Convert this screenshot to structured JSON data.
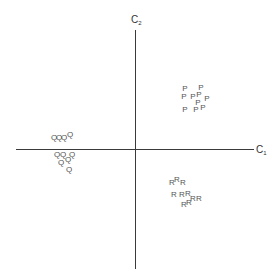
{
  "axes": {
    "x_label": "C",
    "x_sub": "1",
    "y_label": "C",
    "y_sub": "2"
  },
  "clusters": [
    {
      "name": "P",
      "points": [
        {
          "x": 185,
          "y": 89
        },
        {
          "x": 201,
          "y": 88
        },
        {
          "x": 184,
          "y": 97
        },
        {
          "x": 193,
          "y": 97
        },
        {
          "x": 199,
          "y": 95
        },
        {
          "x": 207,
          "y": 99
        },
        {
          "x": 198,
          "y": 103
        },
        {
          "x": 185,
          "y": 110
        },
        {
          "x": 196,
          "y": 110
        },
        {
          "x": 203,
          "y": 108
        }
      ]
    },
    {
      "name": "Q",
      "points": [
        {
          "x": 54,
          "y": 138
        },
        {
          "x": 59,
          "y": 138
        },
        {
          "x": 64,
          "y": 138
        },
        {
          "x": 70,
          "y": 135
        },
        {
          "x": 57,
          "y": 155
        },
        {
          "x": 63,
          "y": 155
        },
        {
          "x": 72,
          "y": 155
        },
        {
          "x": 61,
          "y": 163
        },
        {
          "x": 68,
          "y": 160
        },
        {
          "x": 69,
          "y": 170
        }
      ]
    },
    {
      "name": "R",
      "points": [
        {
          "x": 172,
          "y": 183
        },
        {
          "x": 177,
          "y": 180
        },
        {
          "x": 183,
          "y": 183
        },
        {
          "x": 174,
          "y": 195
        },
        {
          "x": 182,
          "y": 195
        },
        {
          "x": 188,
          "y": 194
        },
        {
          "x": 193,
          "y": 199
        },
        {
          "x": 199,
          "y": 199
        },
        {
          "x": 184,
          "y": 205
        },
        {
          "x": 189,
          "y": 203
        }
      ]
    }
  ]
}
